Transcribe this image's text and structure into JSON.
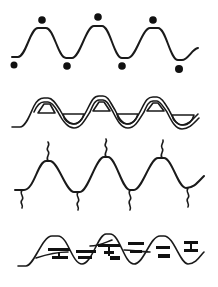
{
  "figure": {
    "background": "#ffffff",
    "ink": "#111111",
    "panels": [
      {
        "id": "dots",
        "description": "wave with dots above peaks and below troughs",
        "peaks": 3
      },
      {
        "id": "loops",
        "description": "double-line wave with triangular loops at peaks and bowl loops at troughs",
        "peaks": 3
      },
      {
        "id": "squiggles",
        "description": "wave with squiggly side chains up from peaks and down from troughs",
        "peaks": 3
      },
      {
        "id": "bars",
        "description": "wave overlaid with horizontal black bar segments",
        "peaks": 3
      }
    ]
  }
}
